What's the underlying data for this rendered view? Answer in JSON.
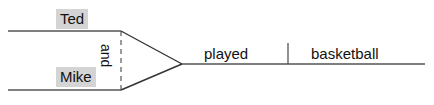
{
  "diagram": {
    "type": "reed-kellogg-sentence-diagram",
    "sentence": "Ted and Mike played basketball",
    "canvas": {
      "width": 434,
      "height": 105
    },
    "colors": {
      "line": "#555555",
      "text": "#111111",
      "highlight": "#d4d4d4",
      "background": "#ffffff"
    },
    "labels": {
      "subject_one": "Ted",
      "subject_two": "Mike",
      "conjunction": "and",
      "verb": "played",
      "direct_object": "basketball"
    },
    "lines": {
      "subject_one_baseline": {
        "x1": 8,
        "y1": 31,
        "x2": 121,
        "y2": 31
      },
      "subject_two_baseline": {
        "x1": 8,
        "y1": 90,
        "x2": 121,
        "y2": 90
      },
      "conjunction_dashed": {
        "x1": 121,
        "y1": 31,
        "x2": 121,
        "y2": 90,
        "dashed": true
      },
      "converge_upper": {
        "x1": 121,
        "y1": 31,
        "x2": 182,
        "y2": 64
      },
      "converge_lower": {
        "x1": 121,
        "y1": 90,
        "x2": 182,
        "y2": 64
      },
      "predicate_baseline": {
        "x1": 182,
        "y1": 64,
        "x2": 425,
        "y2": 64
      },
      "object_divider": {
        "x1": 288,
        "y1": 43,
        "x2": 288,
        "y2": 64
      }
    }
  }
}
